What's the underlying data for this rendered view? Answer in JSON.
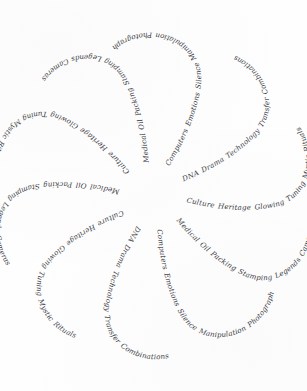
{
  "artwork": {
    "title": "Spiral Pinwheel of Handwritten Phrases",
    "medium": "handwritten cursive ink on white paper",
    "background_color": "#fefefe",
    "ink_color": "#3a3a42",
    "canvas_width": 307,
    "canvas_height": 391,
    "center_x": 153,
    "center_y": 196,
    "arm_count": 10,
    "symmetry": "10-fold rotational pinwheel, each phrase appears twice",
    "layout": "curved S-shaped strands of cursive text radiating from a blank center"
  },
  "phrases": [
    {
      "id": "phrase-computers-emotions",
      "text": "Computers Emotions Silence Manipulation Photographs Cells"
    },
    {
      "id": "phrase-dna-drama",
      "text": "DNA Drama Technology Transfer Combinations"
    },
    {
      "id": "phrase-culture-heritage",
      "text": "Culture Heritage Glowing Tuning Mystic Rituals"
    },
    {
      "id": "phrase-medical-oil",
      "text": "Medical Oil Packing Stamping Legends Cameras"
    },
    {
      "id": "phrase-computers-emotions-2",
      "text": "Computers Emotions Silence Manipulation Photographs Cells"
    },
    {
      "id": "phrase-dna-drama-2",
      "text": "DNA Drama Technology Transfer Combinations"
    },
    {
      "id": "phrase-culture-heritage-2",
      "text": "Culture Heritage Glowing Tuning Mystic Rituals"
    },
    {
      "id": "phrase-medical-oil-2",
      "text": "Medical Oil Packing Stamping Legends Cameras"
    },
    {
      "id": "phrase-culture-heritage-3",
      "text": "Culture Heritage Glowing Tuning Mystic Rituals"
    },
    {
      "id": "phrase-medical-oil-3",
      "text": "Medical Oil Packing Stamping Legends Cameras"
    }
  ],
  "strands": [
    {
      "name": "strand-top-center",
      "phrase_index": 0,
      "rotation": 0
    },
    {
      "name": "strand-top-right",
      "phrase_index": 1,
      "rotation": 36
    },
    {
      "name": "strand-right-upper",
      "phrase_index": 2,
      "rotation": 72
    },
    {
      "name": "strand-right-lower",
      "phrase_index": 3,
      "rotation": 108
    },
    {
      "name": "strand-bottom-right",
      "phrase_index": 4,
      "rotation": 144
    },
    {
      "name": "strand-bottom-center",
      "phrase_index": 5,
      "rotation": 180
    },
    {
      "name": "strand-bottom-left",
      "phrase_index": 6,
      "rotation": 216
    },
    {
      "name": "strand-left-lower",
      "phrase_index": 7,
      "rotation": 252
    },
    {
      "name": "strand-left-upper",
      "phrase_index": 8,
      "rotation": 288
    },
    {
      "name": "strand-top-left",
      "phrase_index": 9,
      "rotation": 324
    }
  ]
}
